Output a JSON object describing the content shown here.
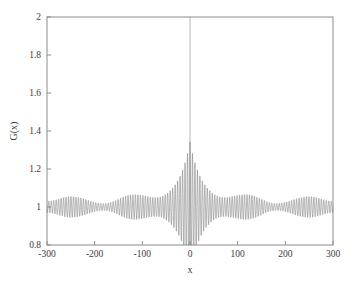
{
  "figure": {
    "background_color": "#ffffff",
    "plot_background_color": "#ffffff",
    "frame_color": "#8c8c8c",
    "line_color": "#7d7d7d",
    "text_color": "#3a3a3a"
  },
  "chart_data": {
    "type": "line",
    "title": "",
    "xlabel": "x",
    "ylabel": "G(x)",
    "xlim": [
      -300,
      300
    ],
    "ylim": [
      0.8,
      2
    ],
    "xticks": [
      -300,
      -200,
      -100,
      0,
      100,
      200,
      300
    ],
    "xticklabels": [
      "-300",
      "-200",
      "-100",
      "0",
      "100",
      "200",
      "300"
    ],
    "yticks": [
      0.8,
      1,
      1.2,
      1.4,
      1.6,
      1.8,
      2
    ],
    "yticklabels": [
      "0.8",
      "1",
      "1.2",
      "1.4",
      "1.6",
      "1.8",
      "2"
    ],
    "grid": false,
    "legend": null,
    "series": [
      {
        "name": "G(x)",
        "baseline": 1.0,
        "carrier_period": 5.2,
        "spike": {
          "x": 0,
          "value": 2.0,
          "half_width": 0.8
        },
        "central_cusp": {
          "x": 0,
          "peak": 1.33,
          "decay_scale": 26
        },
        "envelope_amplitude_nodes": {
          "x": [
            -300,
            -250,
            -180,
            -120,
            -50,
            0,
            50,
            120,
            180,
            250,
            300
          ],
          "amplitude": [
            0.03,
            0.055,
            0.018,
            0.062,
            0.02,
            0.33,
            0.02,
            0.062,
            0.018,
            0.055,
            0.03
          ]
        },
        "envelope_max_value": 1.062,
        "envelope_min_value": 0.938,
        "n_points": 4200
      }
    ]
  }
}
